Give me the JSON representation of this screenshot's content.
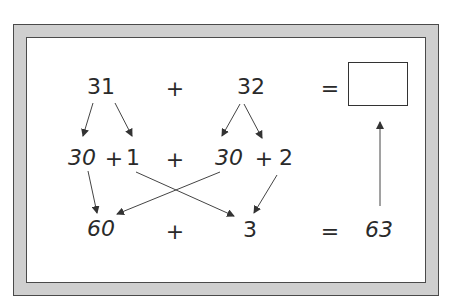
{
  "diagram": {
    "row1": {
      "addend1": "31",
      "plus": "+",
      "addend2": "32",
      "equals": "=",
      "answer": ""
    },
    "row2": {
      "split1_tens": "30",
      "split1_plus": "+",
      "split1_ones": "1",
      "plus": "+",
      "split2_tens": "30",
      "split2_plus": "+",
      "split2_ones": "2"
    },
    "row3": {
      "tens_sum": "60",
      "plus": "+",
      "ones_sum": "3",
      "equals": "=",
      "result": "63"
    },
    "colors": {
      "frame": "#cfcfcf",
      "stroke": "#4a4a4a",
      "text": "#2a2a2a"
    }
  }
}
